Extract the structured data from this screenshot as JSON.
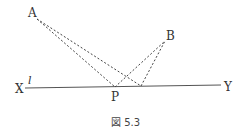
{
  "figure": {
    "caption": "図 5.3",
    "labels": {
      "A": "A",
      "B": "B",
      "P": "P",
      "X": "X",
      "Y": "Y",
      "l": "l"
    },
    "points": {
      "A": [
        37,
        19
      ],
      "B": [
        165,
        41
      ],
      "P": [
        115,
        87
      ],
      "Q": [
        141,
        86
      ],
      "X_end": [
        25,
        88
      ],
      "Y_end": [
        221,
        85
      ]
    },
    "colors": {
      "line": "#555555",
      "dashed": "#444444",
      "text": "#333333"
    }
  }
}
